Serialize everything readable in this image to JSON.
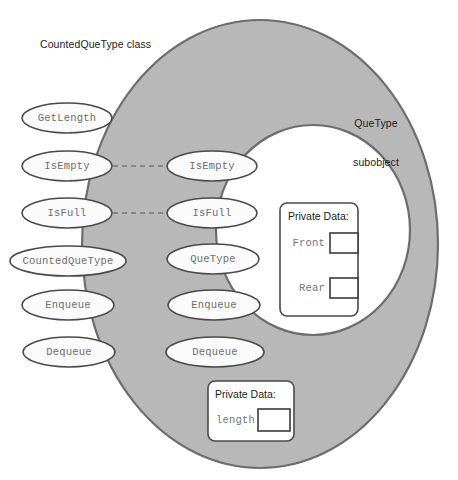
{
  "diagram": {
    "type": "uml-object-composition-diagram",
    "outer_label": "CountedQueType class",
    "subobject_label_line1": "QueType",
    "subobject_label_line2": "subobject",
    "colors": {
      "outer_fill": "#b8b8b8",
      "outer_stroke": "#6d6d6d",
      "inner_fill": "#ffffff",
      "inner_stroke": "#6d6d6d",
      "ellipse_fill": "#fbfbfb",
      "ellipse_stroke": "#4a4a4a",
      "connector": "#555555",
      "box_stroke": "#4a4a4a",
      "box_fill": "#ffffff",
      "value_box_stroke": "#3a3a3a",
      "page_background": "#ffffff"
    }
  },
  "outer_class": {
    "name": "CountedQueType class",
    "operations": [
      {
        "label": "GetLength",
        "cx": 67,
        "cy": 118,
        "rx": 45,
        "ry": 15
      },
      {
        "label": "IsEmpty",
        "cx": 67,
        "cy": 166,
        "rx": 45,
        "ry": 15
      },
      {
        "label": "IsFull",
        "cx": 67,
        "cy": 213,
        "rx": 45,
        "ry": 15
      },
      {
        "label": "CountedQueType",
        "cx": 68,
        "cy": 261,
        "rx": 58,
        "ry": 15
      },
      {
        "label": "Enqueue",
        "cx": 68,
        "cy": 305,
        "rx": 46,
        "ry": 15
      },
      {
        "label": "Dequeue",
        "cx": 69,
        "cy": 352,
        "rx": 46,
        "ry": 15
      }
    ],
    "private_data": {
      "title": "Private Data:",
      "fields": [
        {
          "name": "length",
          "value": ""
        }
      ]
    }
  },
  "subobject": {
    "name": "QueType subobject",
    "operations": [
      {
        "label": "IsEmpty",
        "cx": 212,
        "cy": 166,
        "rx": 45,
        "ry": 15
      },
      {
        "label": "IsFull",
        "cx": 212,
        "cy": 213,
        "rx": 45,
        "ry": 15
      },
      {
        "label": "QueType",
        "cx": 213,
        "cy": 259,
        "rx": 46,
        "ry": 15
      },
      {
        "label": "Enqueue",
        "cx": 214,
        "cy": 305,
        "rx": 46,
        "ry": 15
      },
      {
        "label": "Dequeue",
        "cx": 215,
        "cy": 352,
        "rx": 49,
        "ry": 15
      }
    ],
    "private_data": {
      "title": "Private Data:",
      "fields": [
        {
          "name": "Front",
          "value": ""
        },
        {
          "name": "Rear",
          "value": ""
        }
      ]
    }
  },
  "connectors": [
    {
      "from": "IsEmpty",
      "to": "IsEmpty",
      "style": "dashed",
      "y": 166,
      "x1": 113,
      "x2": 167
    },
    {
      "from": "IsFull",
      "to": "IsFull",
      "style": "dashed",
      "y": 213,
      "x1": 113,
      "x2": 167
    }
  ]
}
